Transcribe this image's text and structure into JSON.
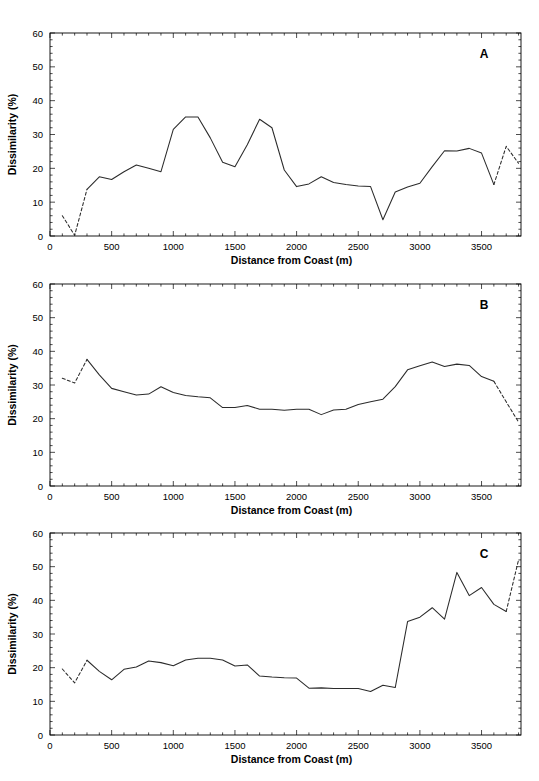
{
  "figure": {
    "panels_count": 3,
    "axis": {
      "xlabel": "Distance from Coast (m)",
      "ylabel": "Dissimilarity (%)",
      "xlim": [
        0,
        3820
      ],
      "ylim": [
        0,
        60
      ],
      "xticks": [
        0,
        500,
        1000,
        1500,
        2000,
        2500,
        3000,
        3500
      ],
      "xtick_labels": [
        "0",
        "500",
        "1000",
        "1500",
        "2000",
        "2500",
        "3000",
        "3500"
      ],
      "yticks": [
        0,
        10,
        20,
        30,
        40,
        50,
        60
      ],
      "ytick_labels": [
        "0",
        "10",
        "20",
        "30",
        "40",
        "50",
        "60"
      ],
      "x_minor_step": 100,
      "y_minor_step": 2,
      "grid": false
    },
    "line_color": "#2b2b2b",
    "background_color": "#ffffff",
    "panel_letters": [
      "A",
      "B",
      "C"
    ]
  },
  "chart_data": [
    {
      "id": "A",
      "type": "line",
      "title": "",
      "panel_label": "A",
      "xlabel": "Distance from Coast (m)",
      "ylabel": "Dissimilarity (%)",
      "xlim": [
        0,
        3820
      ],
      "ylim": [
        0,
        60
      ],
      "grid": false,
      "legend": "none",
      "x": [
        100,
        200,
        300,
        400,
        500,
        600,
        700,
        800,
        900,
        1000,
        1100,
        1200,
        1300,
        1400,
        1500,
        1600,
        1700,
        1800,
        1900,
        2000,
        2100,
        2200,
        2300,
        2400,
        2500,
        2600,
        2700,
        2800,
        2900,
        3000,
        3100,
        3200,
        3300,
        3400,
        3500,
        3600,
        3700,
        3800
      ],
      "y": [
        6.0,
        0.2,
        13.8,
        17.5,
        16.7,
        19.0,
        21.0,
        20.0,
        19.0,
        31.5,
        35.2,
        35.2,
        29.0,
        21.8,
        20.5,
        27.0,
        34.5,
        32.0,
        19.5,
        14.6,
        15.4,
        17.5,
        15.8,
        15.2,
        14.8,
        14.6,
        4.8,
        13.0,
        14.5,
        15.6,
        20.5,
        25.2,
        25.1,
        25.9,
        24.5,
        15.2,
        26.5,
        21.5
      ],
      "dashed_segments": [
        {
          "x_from": 100,
          "x_to": 300,
          "note": "extrapolated leading segment"
        },
        {
          "x_from": 3600,
          "x_to": 3800,
          "note": "extrapolated trailing segment"
        }
      ]
    },
    {
      "id": "B",
      "type": "line",
      "title": "",
      "panel_label": "B",
      "xlabel": "Distance from Coast (m)",
      "ylabel": "Dissimilarity (%)",
      "xlim": [
        0,
        3820
      ],
      "ylim": [
        0,
        60
      ],
      "grid": false,
      "legend": "none",
      "x": [
        100,
        200,
        300,
        400,
        500,
        600,
        700,
        800,
        900,
        1000,
        1100,
        1200,
        1300,
        1400,
        1500,
        1600,
        1700,
        1800,
        1900,
        2000,
        2100,
        2200,
        2300,
        2400,
        2500,
        2600,
        2700,
        2800,
        2900,
        3000,
        3100,
        3200,
        3300,
        3400,
        3500,
        3600,
        3700,
        3800
      ],
      "y": [
        32.0,
        30.6,
        37.6,
        33.0,
        29.0,
        28.0,
        27.0,
        27.3,
        29.5,
        27.8,
        26.9,
        26.5,
        26.2,
        23.3,
        23.3,
        23.9,
        22.8,
        22.8,
        22.5,
        22.8,
        22.8,
        21.2,
        22.6,
        22.8,
        24.2,
        25.0,
        25.8,
        29.5,
        34.5,
        35.7,
        36.8,
        35.5,
        36.2,
        35.8,
        32.5,
        31.1,
        25.0,
        19.0
      ],
      "dashed_segments": [
        {
          "x_from": 100,
          "x_to": 300,
          "note": "extrapolated leading segment"
        },
        {
          "x_from": 3600,
          "x_to": 3800,
          "note": "extrapolated trailing segment"
        }
      ]
    },
    {
      "id": "C",
      "type": "line",
      "title": "",
      "panel_label": "C",
      "xlabel": "Distance from Coast (m)",
      "ylabel": "Dissimilarity (%)",
      "xlim": [
        0,
        3820
      ],
      "ylim": [
        0,
        60
      ],
      "grid": false,
      "legend": "none",
      "x": [
        100,
        200,
        300,
        400,
        500,
        600,
        700,
        800,
        900,
        1000,
        1100,
        1200,
        1300,
        1400,
        1500,
        1600,
        1700,
        1800,
        1900,
        2000,
        2100,
        2200,
        2300,
        2400,
        2500,
        2600,
        2700,
        2800,
        2900,
        3000,
        3100,
        3200,
        3300,
        3400,
        3500,
        3600,
        3700,
        3800
      ],
      "y": [
        19.6,
        15.5,
        22.2,
        18.9,
        16.4,
        19.5,
        20.2,
        22.0,
        21.5,
        20.6,
        22.3,
        22.8,
        22.8,
        22.3,
        20.5,
        20.8,
        17.5,
        17.2,
        17.0,
        16.9,
        13.9,
        14.0,
        13.8,
        13.8,
        13.8,
        12.9,
        14.8,
        14.1,
        33.7,
        35.0,
        37.8,
        34.4,
        48.3,
        41.4,
        43.8,
        38.8,
        36.7,
        52.0
      ],
      "dashed_segments": [
        {
          "x_from": 100,
          "x_to": 300,
          "note": "extrapolated leading segment"
        },
        {
          "x_from": 3700,
          "x_to": 3800,
          "note": "extrapolated trailing segment"
        }
      ]
    }
  ]
}
